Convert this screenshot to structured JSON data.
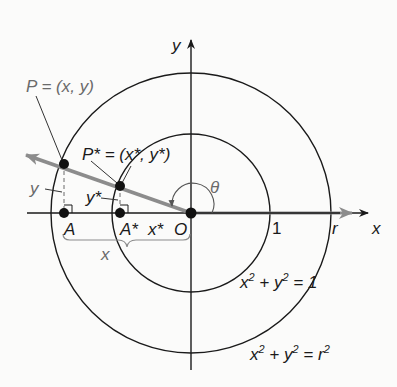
{
  "figure": {
    "colors": {
      "background": "#fbfbfa",
      "axis": "#1a1a1a",
      "ray": "#8c8c8c",
      "label_gray": "#6a6a6a",
      "label_dark": "#1a1a1a"
    },
    "geometry": {
      "origin": [
        191,
        213
      ],
      "unit_radius": 78,
      "outer_radius": 139,
      "point_P": [
        64,
        164
      ],
      "point_P_star": [
        120,
        186
      ],
      "point_A": [
        64,
        213
      ],
      "point_A_star": [
        120,
        213
      ]
    },
    "labels": {
      "y_axis": "y",
      "x_axis": "x",
      "P": "P = (x, y)",
      "P_star_prefix": "P* = (x*, ",
      "P_star_y": "y*",
      "P_star_suffix": ")",
      "y_leader": "y",
      "y_star_leader": "y*",
      "A": "A",
      "A_star": "A*",
      "x_star": "x*",
      "O": "O",
      "x_brace": "x",
      "theta": "θ",
      "one": "1",
      "r": "r",
      "unit_eq_x": "x",
      "unit_eq_mid": " + y",
      "unit_eq_end": " = 1",
      "outer_eq_x": "x",
      "outer_eq_mid": " + y",
      "outer_eq_end": " = r",
      "sq": "2"
    }
  }
}
